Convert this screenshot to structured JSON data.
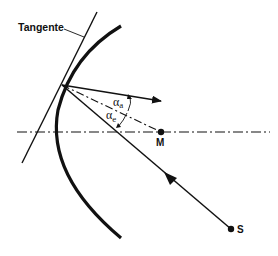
{
  "diagram": {
    "labels": {
      "tangent": "Tangente",
      "center": "M",
      "source": "S",
      "angle_reflected": "α",
      "angle_reflected_sub": "a",
      "angle_incident": "α",
      "angle_incident_sub": "e"
    },
    "colors": {
      "stroke": "#111111",
      "background": "#ffffff"
    }
  }
}
